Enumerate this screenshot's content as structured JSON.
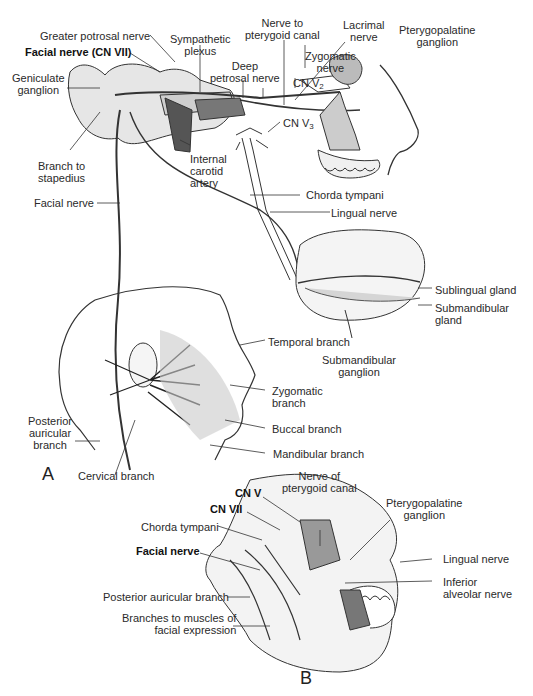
{
  "figure": {
    "panels": [
      {
        "id": "A",
        "label": "A"
      },
      {
        "id": "B",
        "label": "B"
      }
    ],
    "panel_a": {
      "labels": {
        "greater_petrosal": "Greater potrosal nerve",
        "sympathetic_plexus": "Sympathetic\nplexus",
        "nerve_pterygoid_canal": "Nerve to\npterygoid canal",
        "lacrimal_nerve": "Lacrimal\nnerve",
        "pterygopalatine_ganglion": "Pterygopalatine\nganglion",
        "facial_nerve_cn7": "Facial nerve (CN VII)",
        "geniculate_ganglion": "Geniculate\nganglion",
        "deep_petrosal": "Deep\npetrosal nerve",
        "zygomatic_nerve": "Zygomatic\nnerve",
        "cn_v2": "CN V",
        "cn_v2_sub": "2",
        "cn_v3": "CN V",
        "cn_v3_sub": "3",
        "branch_stapedius": "Branch to\nstapedius",
        "internal_carotid": "Internal\ncarotid\nartery",
        "facial_nerve": "Facial nerve",
        "chorda_tympani": "Chorda tympani",
        "lingual_nerve": "Lingual nerve",
        "sublingual_gland": "Sublingual gland",
        "submandibular_gland": "Submandibular\ngland",
        "submandibular_ganglion": "Submandibular\nganglion",
        "temporal_branch": "Temporal branch",
        "zygomatic_branch": "Zygomatic\nbranch",
        "buccal_branch": "Buccal branch",
        "mandibular_branch": "Mandibular branch",
        "posterior_auricular": "Posterior\nauricular\nbranch",
        "cervical_branch": "Cervical branch"
      }
    },
    "panel_b": {
      "labels": {
        "pterygopalatine_ganglion": "Pterygopalatine\nganglion",
        "nerve_pterygoid_canal": "Nerve of\npterygoid canal",
        "cn_v": "CN V",
        "cn_vii": "CN VII",
        "chorda_tympani": "Chorda tympani",
        "facial_nerve": "Facial nerve",
        "lingual_nerve": "Lingual nerve",
        "inferior_alveolar": "Inferior\nalveolar nerve",
        "posterior_auricular": "Posterior auricular branch",
        "branches_facial_expression": "Branches to muscles of\nfacial expression"
      }
    },
    "colors": {
      "line": "#333333",
      "bone": "#d9d9d9",
      "nerve": "#444444",
      "fill": "#bdbdbd"
    }
  }
}
